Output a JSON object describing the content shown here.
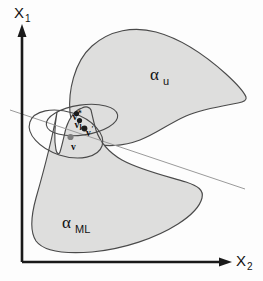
{
  "figure": {
    "background_color": "#fdfdfd"
  },
  "axes": {
    "vertical": {
      "name": "x-1-axis",
      "label_base": "X",
      "label_sub": "1",
      "color": "#1a1a1a"
    },
    "horizontal": {
      "name": "x-2-axis",
      "label_base": "X",
      "label_sub": "2",
      "color": "#1a1a1a"
    }
  },
  "regions": [
    {
      "id": "alpha-u",
      "label_base": "α",
      "label_sub": "u",
      "fill_color": "#dededd",
      "stroke_color": "#4a4a4a",
      "label_x": 150,
      "label_y": 80
    },
    {
      "id": "alpha-ml",
      "label_base": "α",
      "label_sub": "ML",
      "fill_color": "#dededd",
      "stroke_color": "#4a4a4a",
      "label_x": 62,
      "label_y": 228
    }
  ],
  "ellipses": [
    {
      "id": "ellipse-upper",
      "stroke_color": "#4a4a4a"
    },
    {
      "id": "ellipse-lower",
      "stroke_color": "#4a4a4a"
    }
  ],
  "ray": {
    "id": "separating-ray",
    "color": "#9a9a9a"
  },
  "points": [
    {
      "id": "v-star",
      "label_base": "v",
      "label_sup": "*",
      "label_sub": "",
      "cx": 76.5,
      "cy": 113.5,
      "r": 2.6,
      "color": "#1b1b1b",
      "label_x": 72.5,
      "label_y": 120.0
    },
    {
      "id": "v-k",
      "label_base": "v",
      "label_sup": "",
      "label_sub": "k",
      "cx": 79.5,
      "cy": 120.5,
      "r": 2.6,
      "color": "#1b1b1b",
      "label_x": 74.5,
      "label_y": 127.5
    },
    {
      "id": "v-prime",
      "label_base": "v",
      "label_sup": "′",
      "label_sub": "",
      "cx": 84.5,
      "cy": 128.5,
      "r": 2.9,
      "color": "#1b1b1b",
      "label_x": 86.0,
      "label_y": 136.0
    },
    {
      "id": "v-plain",
      "label_base": "v",
      "label_sup": "",
      "label_sub": "",
      "cx": 70.5,
      "cy": 137.0,
      "r": 3.1,
      "color": "#7d7d7d",
      "label_x": 71.0,
      "label_y": 150.0
    }
  ]
}
